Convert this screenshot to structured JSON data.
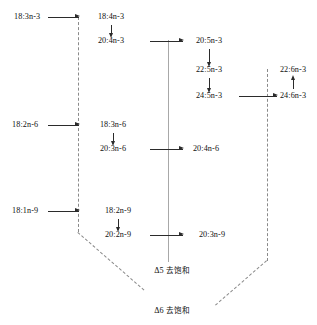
{
  "diagram": {
    "enzymes": [
      {
        "id": "d5",
        "symbol": "Δ5",
        "name": "去饱和"
      },
      {
        "id": "d6",
        "symbol": "Δ6",
        "name": "去饱和"
      }
    ],
    "families": {
      "n3": {
        "precursor": "18:3n-3",
        "chain": [
          "18:4n-3",
          "20:4n-3",
          "20:5n-3",
          "22:5n-3",
          "24:5n-3",
          "24:6n-3",
          "22:6n-3"
        ]
      },
      "n6": {
        "precursor": "18:2n-6",
        "chain": [
          "18:3n-6",
          "20:3n-6",
          "20:4n-6"
        ]
      },
      "n9": {
        "precursor": "18:1n-9",
        "chain": [
          "18:2n-9",
          "20:2n-9",
          "20:3n-9"
        ]
      }
    },
    "nodes": {
      "n3_18_3": "18:3n-3",
      "n3_18_4": "18:4n-3",
      "n3_20_4": "20:4n-3",
      "n3_20_5": "20:5n-3",
      "n3_22_5": "22:5n-3",
      "n3_24_5": "24:5n-3",
      "n3_24_6": "24:6n-3",
      "n3_22_6": "22:6n-3",
      "n6_18_2": "18:2n-6",
      "n6_18_3": "18:3n-6",
      "n6_20_3": "20:3n-6",
      "n6_20_4": "20:4n-6",
      "n9_18_1": "18:1n-9",
      "n9_18_2": "18:2n-9",
      "n9_20_2": "20:2n-9",
      "n9_20_3": "20:3n-9"
    },
    "labels": {
      "delta5_symbol": "Δ5",
      "delta5_name": "去饱和",
      "delta6_symbol": "Δ6",
      "delta6_name": "去饱和"
    },
    "colors": {
      "text": "#111111",
      "arrow": "#2b2b2b",
      "spine": "#a8a8a8",
      "dashed": "#8a8a8a",
      "background": "#ffffff"
    }
  }
}
